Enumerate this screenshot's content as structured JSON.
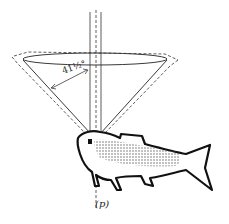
{
  "diagram": {
    "labels": {
      "angle": "41½°",
      "point": "(p)"
    },
    "colors": {
      "ink": "#1a1a1a",
      "background": "#ffffff",
      "stipple": "#555555"
    }
  }
}
